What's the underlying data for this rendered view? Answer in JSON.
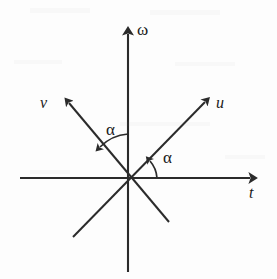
{
  "figure": {
    "kind": "vector-diagram",
    "background_color": "#fdfdfd",
    "stroke_color": "#2b2b2b",
    "labels": {
      "omega": "ω",
      "t": "t",
      "u": "u",
      "v": "v",
      "alpha_upper": "α",
      "alpha_lower": "α"
    },
    "geometry": {
      "origin": {
        "x": 128,
        "y": 178
      },
      "omega_axis": {
        "x1": 128,
        "y1": 272,
        "x2": 128,
        "y2": 26,
        "arrow": "up"
      },
      "t_axis": {
        "x1": 20,
        "y1": 178,
        "x2": 259,
        "y2": 178,
        "arrow": "right"
      },
      "u_axis": {
        "x1": 73,
        "y1": 237,
        "x2": 211,
        "y2": 97,
        "arrow": "up-right"
      },
      "v_axis": {
        "x1": 169,
        "y1": 222,
        "x2": 63,
        "y2": 97,
        "arrow": "up-left"
      },
      "alpha_degrees": 45
    },
    "label_positions": {
      "omega": {
        "left": 137,
        "top": 21
      },
      "t": {
        "left": 249,
        "top": 186
      },
      "u": {
        "left": 216,
        "top": 95
      },
      "v": {
        "left": 40,
        "top": 95
      },
      "alpha_upper": {
        "left": 106,
        "top": 122
      },
      "alpha_lower": {
        "left": 163,
        "top": 150
      }
    }
  }
}
